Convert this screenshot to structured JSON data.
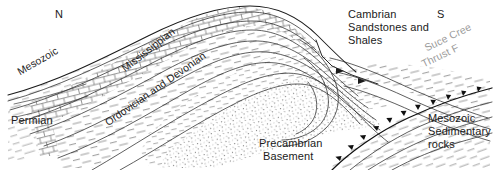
{
  "figure": {
    "type": "geologic-cross-section",
    "orientation": {
      "left_label": "N",
      "right_label": "S"
    },
    "ink_color": "#1b1b1b",
    "fault_label_color": "#9a9a9a",
    "background_color": "#ffffff"
  },
  "labels": {
    "north": "N",
    "south": "S",
    "mesozoic_left": "Mesozoic",
    "mississippian": "Mississippian",
    "ordovician_devonian": "Ordovician and Devonian",
    "permian": "Permian",
    "precambrian_line1": "Precambrian",
    "precambrian_line2": "Basement",
    "cambrian_line1": "Cambrian",
    "cambrian_line2": "Sandstones and",
    "cambrian_line3": "Shales",
    "mesozoic_sed_line1": "Mesozoic",
    "mesozoic_sed_line2": "Sedimentary",
    "mesozoic_sed_line3": "rocks",
    "thrust_line1": "Suce Cree",
    "thrust_line2": "Thrust F"
  },
  "units": [
    {
      "name": "Precambrian Basement",
      "pattern": "stipple"
    },
    {
      "name": "Cambrian Sandstones and Shales",
      "pattern": "fine-dash"
    },
    {
      "name": "Ordovician and Devonian",
      "pattern": "dashes"
    },
    {
      "name": "Mississippian",
      "pattern": "brick-limestone"
    },
    {
      "name": "Permian",
      "pattern": "dashes"
    },
    {
      "name": "Mesozoic Sedimentary rocks",
      "pattern": "dashes"
    }
  ],
  "structures": [
    {
      "name": "Suce Creek Thrust Fault",
      "type": "thrust-fault",
      "teeth_side": "upper-left"
    },
    {
      "name": "anticline",
      "type": "fold"
    }
  ]
}
